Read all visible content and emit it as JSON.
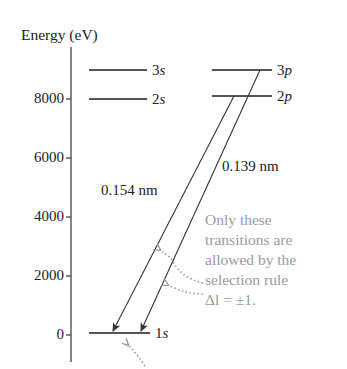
{
  "axis": {
    "title": "Energy (eV)",
    "ticks": [
      {
        "label": "8000",
        "y": 99
      },
      {
        "label": "6000",
        "y": 158
      },
      {
        "label": "4000",
        "y": 217
      },
      {
        "label": "2000",
        "y": 276
      },
      {
        "label": "0",
        "y": 335
      }
    ]
  },
  "levels": {
    "s3": {
      "num": "3",
      "orb": "s"
    },
    "s2": {
      "num": "2",
      "orb": "s"
    },
    "s1": {
      "num": "1",
      "orb": "s"
    },
    "p3": {
      "num": "3",
      "orb": "p"
    },
    "p2": {
      "num": "2",
      "orb": "p"
    }
  },
  "transitions": {
    "t2p": {
      "label": "0.154 nm",
      "from": "2p",
      "to": "1s"
    },
    "t3p": {
      "label": "0.139 nm",
      "from": "3p",
      "to": "1s"
    }
  },
  "annotation": {
    "lines": [
      "Only these",
      "transitions are",
      "allowed by the",
      "selection rule",
      "Δl = ±1."
    ]
  },
  "colors": {
    "ink": "#222222",
    "level_line": "#555555",
    "annotation": "#9a9a9a"
  }
}
